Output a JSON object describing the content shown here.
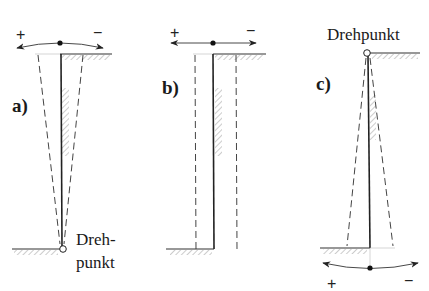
{
  "panels": [
    {
      "id": "a",
      "label": "a)",
      "rotation_plus": "+",
      "rotation_minus": "−",
      "pivot_label_line1": "Dreh-",
      "pivot_label_line2": "punkt",
      "pivot_position": "bottom"
    },
    {
      "id": "b",
      "label": "b)",
      "rotation_plus": "+",
      "rotation_minus": "−",
      "pivot_position": "none (translation)"
    },
    {
      "id": "c",
      "label": "c)",
      "rotation_plus": "+",
      "rotation_minus": "−",
      "pivot_label": "Drehpunkt",
      "pivot_position": "top"
    }
  ],
  "colors": {
    "line": "#222222",
    "dashed": "#444444",
    "hatch": "#9a9a9a",
    "background": "#ffffff"
  }
}
